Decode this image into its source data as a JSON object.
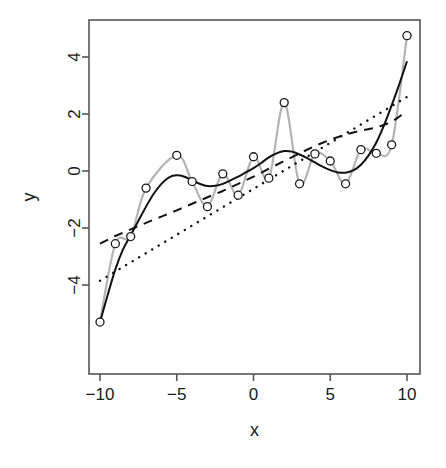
{
  "chart_data": {
    "type": "scatter",
    "title": "",
    "subtitle": "",
    "xlabel": "x",
    "ylabel": "y",
    "xlim": [
      -10.8,
      10.8
    ],
    "ylim": [
      -5.8,
      5.3
    ],
    "grid": false,
    "legend": "none",
    "background": "#ffffff",
    "box_color": "#555555",
    "x_ticks": [
      -10,
      -5,
      0,
      5,
      10
    ],
    "x_tick_labels": [
      "-10",
      "-5",
      "0",
      "5",
      "10"
    ],
    "y_ticks": [
      -4,
      -2,
      0,
      2,
      4
    ],
    "y_tick_labels": [
      "-4",
      "-2",
      "0",
      "2",
      "4"
    ],
    "points": {
      "marker": "open-circle",
      "marker_color": "#1a1a1a",
      "marker_size": 8,
      "x": [
        -10,
        -9,
        -8,
        -7,
        -5,
        -4,
        -3,
        -2,
        -1,
        0,
        1,
        2,
        3,
        4,
        5,
        6,
        7,
        8,
        9,
        10
      ],
      "y": [
        -5.3,
        -2.55,
        -2.3,
        -0.6,
        0.55,
        -0.37,
        -1.25,
        -0.1,
        -0.85,
        0.5,
        -0.25,
        2.4,
        -0.45,
        0.6,
        0.35,
        -0.45,
        0.75,
        0.62,
        0.92,
        4.75
      ]
    },
    "series": [
      {
        "name": "data-interpolating-curve",
        "style": "solid",
        "color": "#b4b4b4",
        "width": 2.2,
        "x": [
          -10,
          -9,
          -8,
          -7,
          -5,
          -4,
          -3,
          -2,
          -1,
          0,
          1,
          2,
          3,
          4,
          5,
          6,
          7,
          8,
          9,
          10
        ],
        "y": [
          -5.3,
          -2.55,
          -2.3,
          -0.6,
          0.55,
          -0.37,
          -1.25,
          -0.1,
          -0.85,
          0.5,
          -0.25,
          2.4,
          -0.45,
          0.6,
          0.35,
          -0.45,
          0.75,
          0.62,
          0.92,
          4.75
        ]
      },
      {
        "name": "smooth-fit",
        "style": "solid",
        "color": "#111111",
        "width": 2.0,
        "x": [
          -10,
          -9.5,
          -9,
          -8.5,
          -8,
          -7.5,
          -7,
          -6.5,
          -6,
          -5.5,
          -5,
          -4.5,
          -4,
          -3.5,
          -3,
          -2.5,
          -2,
          -1.5,
          -1,
          -0.5,
          0,
          0.5,
          1,
          1.5,
          2,
          2.5,
          3,
          3.5,
          4,
          4.5,
          5,
          5.5,
          6,
          6.5,
          7,
          7.5,
          8,
          8.5,
          9,
          9.5,
          10
        ],
        "y": [
          -5.3,
          -4.35,
          -3.45,
          -2.75,
          -2.25,
          -1.75,
          -1.25,
          -0.8,
          -0.45,
          -0.22,
          -0.15,
          -0.2,
          -0.33,
          -0.45,
          -0.53,
          -0.52,
          -0.45,
          -0.33,
          -0.2,
          -0.05,
          0.1,
          0.28,
          0.48,
          0.62,
          0.7,
          0.68,
          0.58,
          0.45,
          0.3,
          0.15,
          0.03,
          -0.05,
          -0.06,
          0.02,
          0.22,
          0.55,
          1.0,
          1.6,
          2.3,
          3.05,
          3.85
        ]
      },
      {
        "name": "dotted-fit",
        "style": "dotted",
        "color": "#111111",
        "width": 2.4,
        "x": [
          -10,
          10
        ],
        "y": [
          -3.85,
          2.6
        ]
      },
      {
        "name": "dashed-fit",
        "style": "dashed",
        "color": "#111111",
        "width": 2.0,
        "x": [
          -10,
          -9,
          -8,
          -7,
          -6,
          -5,
          -4,
          -3,
          -2,
          -1,
          0,
          1,
          2,
          3,
          4,
          5,
          6,
          7,
          8,
          9,
          10
        ],
        "y": [
          -2.55,
          -2.28,
          -2.05,
          -1.82,
          -1.6,
          -1.38,
          -1.15,
          -0.92,
          -0.7,
          -0.45,
          -0.2,
          0.08,
          0.35,
          0.62,
          0.88,
          1.1,
          1.28,
          1.42,
          1.52,
          1.72,
          2.1
        ]
      }
    ]
  }
}
